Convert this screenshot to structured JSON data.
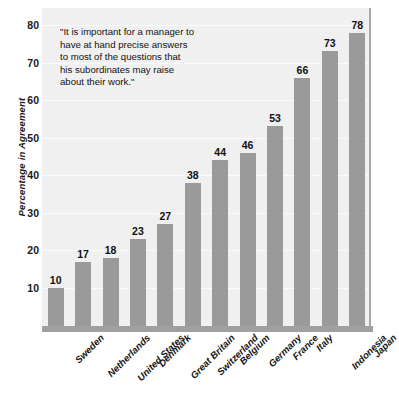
{
  "chart_data": {
    "type": "bar",
    "title": "",
    "xlabel": "",
    "ylabel": "Percentage in Agreement",
    "ylim": [
      0,
      85
    ],
    "yticks": [
      10,
      20,
      30,
      40,
      50,
      60,
      70,
      80
    ],
    "grid": true,
    "legend": "none",
    "categories": [
      "Sweden",
      "Netherlands",
      "United States",
      "Denmark",
      "Great Britain",
      "Switzerland",
      "Belgium",
      "Germany",
      "France",
      "Italy",
      "Indonesia",
      "Japan"
    ],
    "values": [
      10,
      17,
      18,
      23,
      27,
      38,
      44,
      46,
      53,
      66,
      73,
      78
    ],
    "annotations": [
      {
        "name": "survey-question-quote",
        "lines": [
          "\"It is important for a manager to",
          "have at hand precise answers",
          "to most of the questions that",
          "his subordinates may raise",
          "about their work.\""
        ]
      }
    ],
    "colors": {
      "bar": "#9a9a9a",
      "plot_background": "#f0f0f0",
      "gridline": "#fbfbfb",
      "axis": "#a0a0a0",
      "text": "#111111"
    }
  }
}
